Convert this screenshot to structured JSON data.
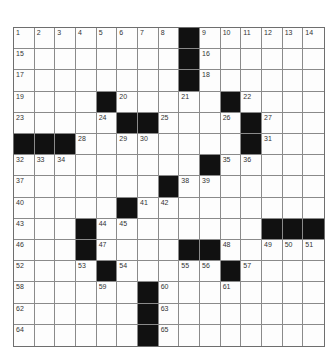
{
  "puzzle": {
    "rows": 15,
    "cols": 15,
    "colors": {
      "black": "#111111",
      "white": "#fdfdfd",
      "line": "#8a8a8a"
    },
    "black_squares": [
      [
        0,
        8
      ],
      [
        1,
        8
      ],
      [
        2,
        8
      ],
      [
        3,
        4
      ],
      [
        3,
        10
      ],
      [
        4,
        5
      ],
      [
        4,
        6
      ],
      [
        4,
        11
      ],
      [
        5,
        0
      ],
      [
        5,
        1
      ],
      [
        5,
        2
      ],
      [
        5,
        11
      ],
      [
        6,
        9
      ],
      [
        7,
        7
      ],
      [
        8,
        5
      ],
      [
        9,
        3
      ],
      [
        9,
        12
      ],
      [
        9,
        13
      ],
      [
        9,
        14
      ],
      [
        10,
        3
      ],
      [
        10,
        8
      ],
      [
        10,
        9
      ],
      [
        11,
        4
      ],
      [
        11,
        10
      ],
      [
        12,
        6
      ],
      [
        13,
        6
      ],
      [
        14,
        6
      ]
    ],
    "numbers": [
      {
        "r": 0,
        "c": 0,
        "n": "1"
      },
      {
        "r": 0,
        "c": 1,
        "n": "2"
      },
      {
        "r": 0,
        "c": 2,
        "n": "3"
      },
      {
        "r": 0,
        "c": 3,
        "n": "4"
      },
      {
        "r": 0,
        "c": 4,
        "n": "5"
      },
      {
        "r": 0,
        "c": 5,
        "n": "6"
      },
      {
        "r": 0,
        "c": 6,
        "n": "7"
      },
      {
        "r": 0,
        "c": 7,
        "n": "8"
      },
      {
        "r": 0,
        "c": 9,
        "n": "9"
      },
      {
        "r": 0,
        "c": 10,
        "n": "10"
      },
      {
        "r": 0,
        "c": 11,
        "n": "11"
      },
      {
        "r": 0,
        "c": 12,
        "n": "12"
      },
      {
        "r": 0,
        "c": 13,
        "n": "13"
      },
      {
        "r": 0,
        "c": 14,
        "n": "14"
      },
      {
        "r": 1,
        "c": 0,
        "n": "15"
      },
      {
        "r": 1,
        "c": 9,
        "n": "16"
      },
      {
        "r": 2,
        "c": 0,
        "n": "17"
      },
      {
        "r": 2,
        "c": 9,
        "n": "18"
      },
      {
        "r": 3,
        "c": 0,
        "n": "19"
      },
      {
        "r": 3,
        "c": 5,
        "n": "20"
      },
      {
        "r": 3,
        "c": 8,
        "n": "21"
      },
      {
        "r": 3,
        "c": 11,
        "n": "22"
      },
      {
        "r": 4,
        "c": 0,
        "n": "23"
      },
      {
        "r": 4,
        "c": 4,
        "n": "24"
      },
      {
        "r": 4,
        "c": 7,
        "n": "25"
      },
      {
        "r": 4,
        "c": 10,
        "n": "26"
      },
      {
        "r": 4,
        "c": 12,
        "n": "27"
      },
      {
        "r": 5,
        "c": 3,
        "n": "28"
      },
      {
        "r": 5,
        "c": 5,
        "n": "29"
      },
      {
        "r": 5,
        "c": 6,
        "n": "30"
      },
      {
        "r": 5,
        "c": 12,
        "n": "31"
      },
      {
        "r": 6,
        "c": 0,
        "n": "32"
      },
      {
        "r": 6,
        "c": 1,
        "n": "33"
      },
      {
        "r": 6,
        "c": 2,
        "n": "34"
      },
      {
        "r": 6,
        "c": 10,
        "n": "35"
      },
      {
        "r": 6,
        "c": 11,
        "n": "36"
      },
      {
        "r": 7,
        "c": 0,
        "n": "37"
      },
      {
        "r": 7,
        "c": 8,
        "n": "38"
      },
      {
        "r": 7,
        "c": 9,
        "n": "39"
      },
      {
        "r": 8,
        "c": 0,
        "n": "40"
      },
      {
        "r": 8,
        "c": 6,
        "n": "41"
      },
      {
        "r": 8,
        "c": 7,
        "n": "42"
      },
      {
        "r": 9,
        "c": 0,
        "n": "43"
      },
      {
        "r": 9,
        "c": 4,
        "n": "44"
      },
      {
        "r": 9,
        "c": 5,
        "n": "45"
      },
      {
        "r": 10,
        "c": 0,
        "n": "46"
      },
      {
        "r": 10,
        "c": 4,
        "n": "47"
      },
      {
        "r": 10,
        "c": 10,
        "n": "48"
      },
      {
        "r": 10,
        "c": 12,
        "n": "49"
      },
      {
        "r": 10,
        "c": 13,
        "n": "50"
      },
      {
        "r": 10,
        "c": 14,
        "n": "51"
      },
      {
        "r": 11,
        "c": 0,
        "n": "52"
      },
      {
        "r": 11,
        "c": 3,
        "n": "53"
      },
      {
        "r": 11,
        "c": 5,
        "n": "54"
      },
      {
        "r": 11,
        "c": 8,
        "n": "55"
      },
      {
        "r": 11,
        "c": 9,
        "n": "56"
      },
      {
        "r": 11,
        "c": 11,
        "n": "57"
      },
      {
        "r": 12,
        "c": 0,
        "n": "58"
      },
      {
        "r": 12,
        "c": 4,
        "n": "59"
      },
      {
        "r": 12,
        "c": 7,
        "n": "60"
      },
      {
        "r": 12,
        "c": 10,
        "n": "61"
      },
      {
        "r": 13,
        "c": 0,
        "n": "62"
      },
      {
        "r": 13,
        "c": 7,
        "n": "63"
      },
      {
        "r": 14,
        "c": 0,
        "n": "64"
      },
      {
        "r": 14,
        "c": 7,
        "n": "65"
      }
    ]
  }
}
